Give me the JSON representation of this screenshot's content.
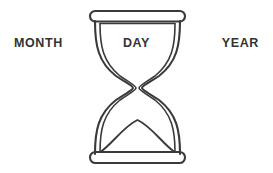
{
  "figure": {
    "type": "line-art-diagram",
    "background_color": "#ffffff",
    "stroke_color": "#3a3a3a",
    "text_color": "#333333"
  },
  "labels": {
    "left": "MONTH",
    "center": "DAY",
    "right": "YEAR"
  },
  "hourglass": {
    "top_cap": "rounded-bar",
    "bottom_cap": "rounded-bar",
    "glass": "double-walled-bulbs",
    "waist": "narrow-neck",
    "sand_line_top": "horizontal",
    "sand_mound_bottom": "arc"
  }
}
